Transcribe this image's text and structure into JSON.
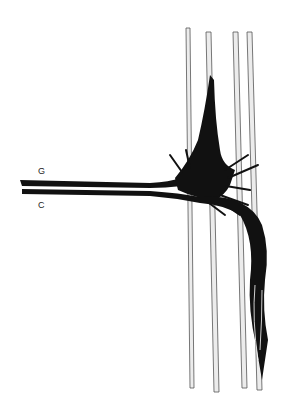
{
  "figure": {
    "labels": {
      "g": "G",
      "c": "C"
    },
    "colors": {
      "background": "#ffffff",
      "ink": "#111111",
      "fiber_edge": "#555555",
      "fiber_fill": "#e8e8e8"
    }
  }
}
